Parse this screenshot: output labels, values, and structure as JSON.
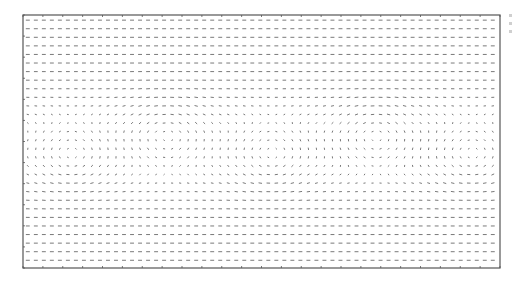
{
  "chart_data": {
    "type": "quiver",
    "title": "",
    "xlabel": "",
    "ylabel": "",
    "grid": false,
    "legend": null,
    "frame": {
      "x0": 23,
      "y0": 15,
      "x1": 500,
      "y1": 268,
      "color": "#555555"
    },
    "arrow_color": "#6a6a6a",
    "sampling": {
      "cols": 59,
      "rows": 29,
      "dx_px": 8.1,
      "dy_px": 8.7
    },
    "background_flow": [
      {
        "region": "top",
        "direction_deg": 180,
        "magnitude": 0.8
      },
      {
        "region": "bottom",
        "direction_deg": 180,
        "magnitude": 0.7
      }
    ],
    "vortices": [
      {
        "cx_frac": 0.1,
        "cy_frac": 0.55,
        "strength": 1.0
      },
      {
        "cx_frac": 0.3,
        "cy_frac": 0.48,
        "strength": -1.0
      },
      {
        "cx_frac": 0.52,
        "cy_frac": 0.55,
        "strength": 1.0
      },
      {
        "cx_frac": 0.74,
        "cy_frac": 0.48,
        "strength": -1.0
      },
      {
        "cx_frac": 0.94,
        "cy_frac": 0.55,
        "strength": 1.0
      }
    ],
    "x_ticks_count": 24,
    "y_ticks_count": 12
  },
  "side_marks": [
    {
      "y": 14,
      "h": 3
    },
    {
      "y": 22,
      "h": 3
    },
    {
      "y": 30,
      "h": 3
    }
  ]
}
